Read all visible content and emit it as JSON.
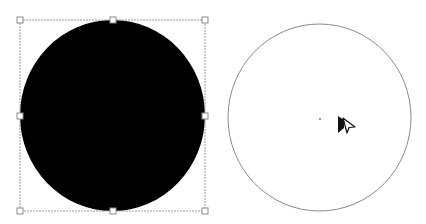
{
  "canvas": {
    "background": "#ffffff",
    "width": 426,
    "height": 224
  },
  "shapes": [
    {
      "id": "filled-circle",
      "type": "ellipse",
      "cx": 112.5,
      "cy": 115.5,
      "rx": 92.5,
      "ry": 95.5,
      "fill": "#000000",
      "stroke": "none",
      "selected": true
    },
    {
      "id": "outline-circle",
      "type": "ellipse",
      "cx": 319.5,
      "cy": 117.5,
      "rx": 91.5,
      "ry": 93.5,
      "fill": "#ffffff",
      "stroke": "#8a8a8a",
      "selected": false,
      "center_marker": {
        "x": 320,
        "y": 119,
        "color": "#999999"
      }
    }
  ],
  "selection": {
    "target": "filled-circle",
    "box": {
      "x": 20,
      "y": 20,
      "width": 185,
      "height": 191
    },
    "border_color": "#9a9a9a",
    "handle_fill": "#ffffff",
    "handle_stroke": "#8a8a8a",
    "handle_size": 6,
    "handles": [
      "top-left",
      "top-center",
      "top-right",
      "middle-left",
      "middle-right",
      "bottom-left",
      "bottom-center",
      "bottom-right"
    ]
  },
  "cursor": {
    "icon": "direct-selection-arrow-icon",
    "x": 338,
    "y": 116
  }
}
